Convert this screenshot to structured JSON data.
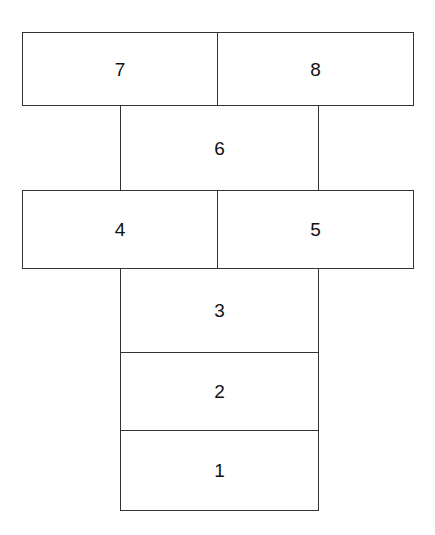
{
  "diagram": {
    "type": "hopscotch-court",
    "stroke_color": "#333333",
    "fill_color": "#ffffff",
    "text_color": "#111111",
    "cells": [
      {
        "id": "cell-1",
        "label": "1",
        "row": 1,
        "span": "single"
      },
      {
        "id": "cell-2",
        "label": "2",
        "row": 2,
        "span": "single"
      },
      {
        "id": "cell-3",
        "label": "3",
        "row": 3,
        "span": "single"
      },
      {
        "id": "cell-4",
        "label": "4",
        "row": 4,
        "span": "left"
      },
      {
        "id": "cell-5",
        "label": "5",
        "row": 4,
        "span": "right"
      },
      {
        "id": "cell-6",
        "label": "6",
        "row": 5,
        "span": "single"
      },
      {
        "id": "cell-7",
        "label": "7",
        "row": 6,
        "span": "left"
      },
      {
        "id": "cell-8",
        "label": "8",
        "row": 6,
        "span": "right"
      }
    ]
  }
}
